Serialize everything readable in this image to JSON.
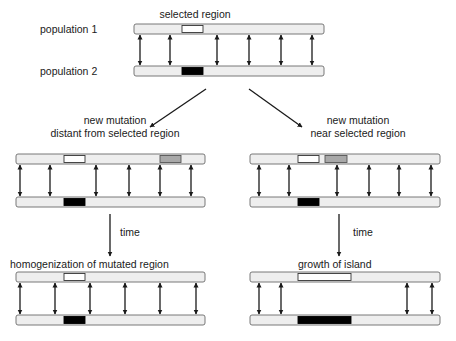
{
  "colors": {
    "bar_fill": "#eeeeee",
    "bar_stroke": "#6a6a6a",
    "selected_pop1": "#ffffff",
    "selected_pop2": "#000000",
    "mutation": "#a8a8a8",
    "arrow": "#1a1a1a"
  },
  "top": {
    "title": "selected region",
    "population1_label": "population 1",
    "population2_label": "population 2"
  },
  "branches": {
    "left_label_line1": "new mutation",
    "left_label_line2": "distant from selected region",
    "right_label_line1": "new mutation",
    "right_label_line2": "near selected region"
  },
  "time": {
    "left_label": "time",
    "right_label": "time"
  },
  "outcomes": {
    "left_label": "homogenization of mutated region",
    "right_label": "growth of island"
  },
  "panels": [
    {
      "id": "initial",
      "bar_x": 134,
      "bar_width": 190,
      "top_y": 24,
      "bottom_y": 66,
      "selected_region": {
        "x": 182,
        "width": 21
      },
      "mutation": null,
      "migration_arrows_x": [
        140,
        170,
        217,
        249,
        281,
        312
      ]
    },
    {
      "id": "distant-mutation",
      "bar_x": 16,
      "bar_width": 189,
      "top_y": 154,
      "bottom_y": 197,
      "selected_region": {
        "x": 64,
        "width": 21
      },
      "mutation": {
        "x": 160,
        "width": 21
      },
      "migration_arrows_x": [
        20,
        50,
        96,
        129,
        160,
        191
      ]
    },
    {
      "id": "near-mutation",
      "bar_x": 250,
      "bar_width": 190,
      "top_y": 154,
      "bottom_y": 197,
      "selected_region": {
        "x": 298,
        "width": 21
      },
      "mutation": {
        "x": 325,
        "width": 22
      },
      "migration_arrows_x": [
        259,
        289,
        337,
        369,
        399,
        431
      ]
    },
    {
      "id": "homogenization",
      "bar_x": 16,
      "bar_width": 189,
      "top_y": 272,
      "bottom_y": 315,
      "selected_region": {
        "x": 64,
        "width": 21
      },
      "mutation": null,
      "migration_arrows_x": [
        20,
        55,
        90,
        125,
        160,
        196
      ]
    },
    {
      "id": "island-growth",
      "bar_x": 250,
      "bar_width": 190,
      "top_y": 272,
      "bottom_y": 315,
      "selected_region": {
        "x": 298,
        "width": 53
      },
      "mutation": null,
      "migration_arrows_x": [
        259,
        281,
        407,
        432
      ]
    }
  ]
}
